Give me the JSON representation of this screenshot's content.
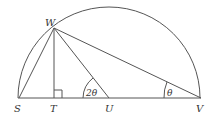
{
  "diagram": {
    "type": "geometry",
    "points": {
      "S": {
        "label": "S",
        "x": 19,
        "y": 98
      },
      "T": {
        "label": "T",
        "x": 54,
        "y": 98
      },
      "U": {
        "label": "U",
        "x": 109,
        "y": 98
      },
      "V": {
        "label": "V",
        "x": 201,
        "y": 98
      },
      "W": {
        "label": "W",
        "x": 54,
        "y": 28
      }
    },
    "segments": [
      "SV",
      "SW",
      "WT",
      "WU",
      "WV"
    ],
    "angles": {
      "at_U": {
        "label": "2θ"
      },
      "at_V": {
        "label": "θ"
      }
    },
    "right_angle_at": "T",
    "colors": {
      "stroke": "#555555",
      "text": "#333333"
    }
  }
}
